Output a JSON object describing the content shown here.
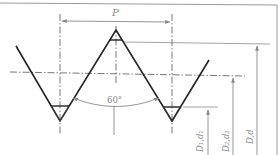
{
  "diagram": {
    "labels": {
      "pitch": "P",
      "angle": "60°",
      "minor_diameter": "D₁,d₁",
      "pitch_diameter": "D₂,d₂",
      "major_diameter": "D,d"
    },
    "colors": {
      "profile": "#222222",
      "dimension": "#8a8a8a",
      "border": "#999999",
      "background": "#ffffff"
    }
  }
}
